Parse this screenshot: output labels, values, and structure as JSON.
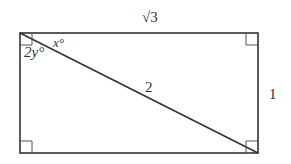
{
  "diagram": {
    "type": "rectangle-with-diagonal",
    "colors": {
      "stroke": "#333333",
      "background": "#ffffff"
    },
    "labels": {
      "top_side": "√3",
      "right_side": "1",
      "diagonal": "2",
      "angle_x": "x°",
      "angle_2y": "2y°"
    },
    "right_angle_marks": [
      "top-left",
      "top-right",
      "bottom-left",
      "bottom-right"
    ]
  }
}
